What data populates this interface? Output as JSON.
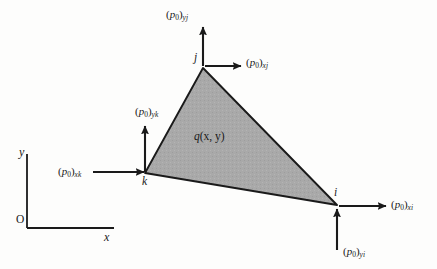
{
  "figure": {
    "background_color": "#fdfdfc",
    "triangle_fill_color": "#a9a9a9",
    "line_color": "#1a1a1a"
  },
  "axes": {
    "x_label": "x",
    "y_label": "y",
    "origin_label": "O"
  },
  "element": {
    "field_label_prefix": "q",
    "field_label_args": "(x, y)",
    "vertices": [
      {
        "id": "j",
        "label": "j",
        "x": 203,
        "y": 68
      },
      {
        "id": "k",
        "label": "k",
        "x": 145,
        "y": 173
      },
      {
        "id": "i",
        "label": "i",
        "x": 337,
        "y": 205
      }
    ]
  },
  "forces": [
    {
      "name": "p0-y-j",
      "base": "p",
      "base_sub": "0",
      "sub": "yj",
      "direction": "up",
      "at_vertex": "j",
      "label_x": 166,
      "label_y": 9
    },
    {
      "name": "p0-x-j",
      "base": "p",
      "base_sub": "0",
      "sub": "xj",
      "direction": "right",
      "at_vertex": "j",
      "label_x": 246,
      "label_y": 57
    },
    {
      "name": "p0-y-k",
      "base": "p",
      "base_sub": "0",
      "sub": "yk",
      "direction": "up",
      "at_vertex": "k",
      "label_x": 135,
      "label_y": 106
    },
    {
      "name": "p0-x-k",
      "base": "p",
      "base_sub": "0",
      "sub": "xk",
      "direction": "right",
      "at_vertex": "k",
      "label_x": 58,
      "label_y": 166
    },
    {
      "name": "p0-x-i",
      "base": "p",
      "base_sub": "0",
      "sub": "xi",
      "direction": "right",
      "at_vertex": "i",
      "label_x": 391,
      "label_y": 199
    },
    {
      "name": "p0-y-i",
      "base": "p",
      "base_sub": "0",
      "sub": "yi",
      "direction": "up",
      "at_vertex": "i",
      "label_x": 343,
      "label_y": 246
    }
  ]
}
